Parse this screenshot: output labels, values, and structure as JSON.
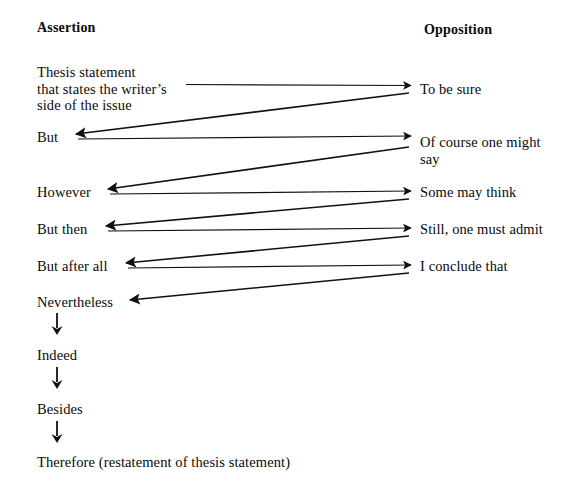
{
  "diagram": {
    "background_color": "#ffffff",
    "line_color": "#111111",
    "columns": {
      "left_header": "Assertion",
      "right_header": "Opposition"
    },
    "assertion_items": [
      {
        "id": "thesis",
        "label": "Thesis statement\nthat states the writer’s\nside of the issue"
      },
      {
        "id": "but",
        "label": "But"
      },
      {
        "id": "however",
        "label": "However"
      },
      {
        "id": "but-then",
        "label": "But then"
      },
      {
        "id": "but-after-all",
        "label": "But after all"
      },
      {
        "id": "nevertheless",
        "label": "Nevertheless"
      },
      {
        "id": "indeed",
        "label": "Indeed"
      },
      {
        "id": "besides",
        "label": "Besides"
      },
      {
        "id": "therefore",
        "label": "Therefore (restatement of thesis statement)"
      }
    ],
    "opposition_items": [
      {
        "id": "to-be-sure",
        "label": "To be sure"
      },
      {
        "id": "of-course-one-might-say",
        "label": "Of course one might\nsay"
      },
      {
        "id": "some-may-think",
        "label": "Some may think"
      },
      {
        "id": "still-one-must-admit",
        "label": "Still, one must admit"
      },
      {
        "id": "i-conclude-that",
        "label": "I conclude that"
      }
    ],
    "connections": {
      "rightward": [
        {
          "from": "thesis",
          "to": "to-be-sure"
        },
        {
          "from": "but",
          "to": "of-course-one-might-say"
        },
        {
          "from": "however",
          "to": "some-may-think"
        },
        {
          "from": "but-then",
          "to": "still-one-must-admit"
        },
        {
          "from": "but-after-all",
          "to": "i-conclude-that"
        }
      ],
      "leftward": [
        {
          "from": "to-be-sure",
          "to": "but"
        },
        {
          "from": "of-course-one-might-say",
          "to": "however"
        },
        {
          "from": "some-may-think",
          "to": "but-then"
        },
        {
          "from": "still-one-must-admit",
          "to": "but-after-all"
        },
        {
          "from": "i-conclude-that",
          "to": "nevertheless"
        }
      ],
      "downward": [
        {
          "from": "nevertheless",
          "to": "indeed"
        },
        {
          "from": "indeed",
          "to": "besides"
        },
        {
          "from": "besides",
          "to": "therefore"
        }
      ]
    }
  }
}
